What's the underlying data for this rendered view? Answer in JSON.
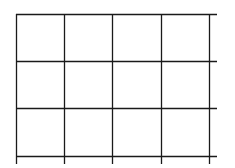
{
  "diagram": {
    "type": "grid",
    "rows": 3,
    "columns": 4,
    "line_color": "#1a1a1a",
    "background_color": "#ffffff",
    "line_width": 1.3,
    "vertical_lines_x": [
      16,
      64,
      112,
      161,
      209
    ],
    "horizontal_lines_y": [
      14,
      61,
      108,
      156
    ],
    "horizontal_extent": {
      "start": 16,
      "end": 217
    },
    "vertical_extent": {
      "start": 14,
      "end": 164
    }
  }
}
